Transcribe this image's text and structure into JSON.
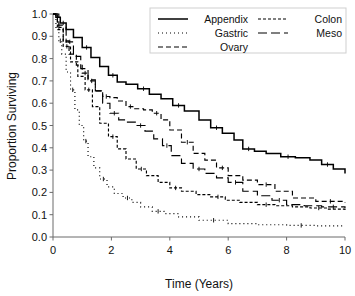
{
  "chart_data": {
    "type": "line",
    "title": "",
    "xlabel": "Time (Years)",
    "ylabel": "Proportion Surviving",
    "xlim": [
      0,
      10
    ],
    "ylim": [
      0.0,
      1.0
    ],
    "xticks": [
      "0",
      "2",
      "4",
      "6",
      "8",
      "10"
    ],
    "xtick_values": [
      0,
      2,
      4,
      6,
      8,
      10
    ],
    "yticks": [
      "0.0",
      "0.1",
      "0.2",
      "0.3",
      "0.4",
      "0.5",
      "0.6",
      "0.7",
      "0.8",
      "0.9",
      "1.0"
    ],
    "ytick_values": [
      0.0,
      0.1,
      0.2,
      0.3,
      0.4,
      0.5,
      0.6,
      0.7,
      0.8,
      0.9,
      1.0
    ],
    "grid": false,
    "legend_position": "top-right",
    "plot_kind": "kaplan-meier-survival",
    "line_color": "#000000",
    "series": [
      {
        "name": "Appendix",
        "dash": "solid",
        "dasharray": "",
        "x": [
          0,
          0.1,
          0.25,
          0.45,
          0.7,
          1.0,
          1.3,
          1.6,
          1.9,
          2.2,
          2.5,
          2.9,
          3.3,
          3.7,
          4.1,
          4.5,
          5.0,
          5.4,
          5.8,
          6.2,
          6.5,
          6.9,
          7.3,
          7.8,
          8.3,
          8.8,
          9.2,
          9.6,
          10.0
        ],
        "y": [
          1.0,
          0.985,
          0.96,
          0.93,
          0.895,
          0.85,
          0.805,
          0.765,
          0.725,
          0.695,
          0.685,
          0.665,
          0.64,
          0.62,
          0.59,
          0.565,
          0.525,
          0.49,
          0.465,
          0.435,
          0.395,
          0.385,
          0.375,
          0.36,
          0.355,
          0.345,
          0.325,
          0.305,
          0.285
        ]
      },
      {
        "name": "Gastric",
        "dash": "dotted",
        "dasharray": "1,3",
        "x": [
          0,
          0.1,
          0.2,
          0.3,
          0.45,
          0.6,
          0.75,
          0.9,
          1.05,
          1.2,
          1.4,
          1.6,
          1.85,
          2.1,
          2.4,
          2.7,
          3.0,
          3.4,
          3.8,
          4.3,
          5.0,
          6.0,
          7.0,
          8.0,
          9.0,
          10.0
        ],
        "y": [
          1.0,
          0.94,
          0.88,
          0.82,
          0.74,
          0.66,
          0.57,
          0.5,
          0.43,
          0.36,
          0.31,
          0.26,
          0.225,
          0.195,
          0.175,
          0.155,
          0.135,
          0.115,
          0.105,
          0.09,
          0.075,
          0.06,
          0.055,
          0.052,
          0.05,
          0.05
        ]
      },
      {
        "name": "Ovary",
        "dash": "dashed",
        "dasharray": "5,3",
        "x": [
          0,
          0.15,
          0.35,
          0.55,
          0.8,
          1.0,
          1.2,
          1.45,
          1.7,
          1.95,
          2.2,
          2.5,
          2.8,
          3.1,
          3.4,
          3.7,
          4.0,
          4.4,
          4.8,
          5.2,
          5.6,
          6.0,
          6.5,
          7.0,
          7.6,
          8.2,
          9.0,
          10.0
        ],
        "y": [
          1.0,
          0.95,
          0.88,
          0.82,
          0.77,
          0.735,
          0.705,
          0.655,
          0.63,
          0.625,
          0.61,
          0.585,
          0.575,
          0.57,
          0.555,
          0.525,
          0.48,
          0.425,
          0.375,
          0.345,
          0.31,
          0.275,
          0.255,
          0.235,
          0.205,
          0.175,
          0.16,
          0.155
        ]
      },
      {
        "name": "Colon",
        "dash": "fine-dashed",
        "dasharray": "3,2",
        "x": [
          0,
          0.15,
          0.35,
          0.6,
          0.85,
          1.1,
          1.35,
          1.6,
          1.9,
          2.2,
          2.5,
          2.85,
          3.2,
          3.6,
          4.0,
          4.4,
          4.9,
          5.4,
          5.9,
          6.4,
          7.0,
          7.6,
          8.2,
          8.8,
          9.4,
          10.0
        ],
        "y": [
          1.0,
          0.93,
          0.855,
          0.785,
          0.72,
          0.66,
          0.585,
          0.51,
          0.45,
          0.395,
          0.35,
          0.305,
          0.275,
          0.245,
          0.22,
          0.205,
          0.19,
          0.18,
          0.165,
          0.155,
          0.145,
          0.14,
          0.135,
          0.13,
          0.125,
          0.12
        ]
      },
      {
        "name": "Meso",
        "dash": "long-dashed",
        "dasharray": "9,4",
        "x": [
          0,
          0.2,
          0.45,
          0.7,
          0.95,
          1.2,
          1.45,
          1.7,
          1.95,
          2.25,
          2.55,
          2.85,
          3.15,
          3.45,
          3.75,
          4.05,
          4.4,
          4.8,
          5.2,
          5.6,
          6.0,
          6.5,
          7.0,
          7.5,
          8.0,
          8.6,
          9.2,
          10.0
        ],
        "y": [
          1.0,
          0.94,
          0.875,
          0.81,
          0.755,
          0.7,
          0.655,
          0.6,
          0.555,
          0.525,
          0.515,
          0.5,
          0.475,
          0.44,
          0.41,
          0.365,
          0.33,
          0.305,
          0.285,
          0.265,
          0.245,
          0.205,
          0.185,
          0.165,
          0.145,
          0.14,
          0.135,
          0.13
        ]
      }
    ]
  },
  "axes": {
    "ylabel": "Proportion Surviving",
    "xlabel": "Time (Years)"
  },
  "legend": {
    "entries": [
      {
        "label": "Appendix",
        "column": "left",
        "row": 0
      },
      {
        "label": "Gastric",
        "column": "left",
        "row": 1
      },
      {
        "label": "Ovary",
        "column": "left",
        "row": 2
      },
      {
        "label": "Colon",
        "column": "right",
        "row": 0
      },
      {
        "label": "Meso",
        "column": "right",
        "row": 1
      }
    ]
  }
}
